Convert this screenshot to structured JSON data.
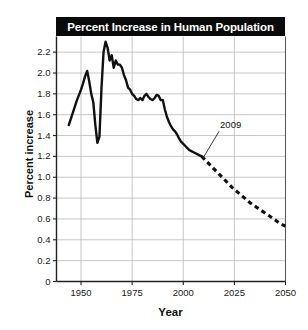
{
  "chart_data": {
    "type": "line",
    "title": "Percent Increase in Human Population",
    "xlabel": "Year",
    "ylabel": "Percent increase",
    "xlim": [
      1938,
      2050
    ],
    "ylim": [
      0,
      2.35
    ],
    "grid": true,
    "legend": false,
    "xticks": [
      "1950",
      "1975",
      "2000",
      "2025",
      "2050"
    ],
    "xtick_values": [
      1950,
      1975,
      2000,
      2025,
      2050
    ],
    "yticks": [
      "0",
      "0.2",
      "0.4",
      "0.6",
      "0.8",
      "1.0",
      "1.2",
      "1.4",
      "1.6",
      "1.8",
      "2.0",
      "2.2"
    ],
    "ytick_values": [
      0,
      0.2,
      0.4,
      0.6,
      0.8,
      1.0,
      1.2,
      1.4,
      1.6,
      1.8,
      2.0,
      2.2
    ],
    "annotations": [
      {
        "text": "2009",
        "x": 2009,
        "y": 1.2,
        "label_x": 2018,
        "label_y": 1.46,
        "leader": true
      }
    ],
    "series": [
      {
        "name": "Observed percent increase",
        "style": "solid",
        "color": "#111111",
        "x": [
          1944,
          1946,
          1948,
          1950,
          1951,
          1952,
          1953,
          1954,
          1955,
          1956,
          1957,
          1958,
          1959,
          1960,
          1961,
          1962,
          1963,
          1964,
          1965,
          1966,
          1967,
          1968,
          1969,
          1970,
          1971,
          1972,
          1973,
          1974,
          1975,
          1976,
          1977,
          1978,
          1979,
          1980,
          1981,
          1982,
          1983,
          1984,
          1985,
          1986,
          1987,
          1988,
          1989,
          1990,
          1991,
          1992,
          1993,
          1994,
          1995,
          1996,
          1997,
          1998,
          1999,
          2000,
          2001,
          2002,
          2003,
          2004,
          2005,
          2006,
          2007,
          2008,
          2009
        ],
        "y": [
          1.5,
          1.62,
          1.74,
          1.84,
          1.9,
          1.97,
          2.02,
          1.92,
          1.8,
          1.72,
          1.5,
          1.33,
          1.39,
          1.85,
          2.2,
          2.3,
          2.24,
          2.12,
          2.17,
          2.05,
          2.12,
          2.08,
          2.08,
          2.05,
          1.98,
          1.93,
          1.86,
          1.84,
          1.8,
          1.78,
          1.75,
          1.74,
          1.76,
          1.74,
          1.78,
          1.8,
          1.77,
          1.75,
          1.74,
          1.76,
          1.79,
          1.78,
          1.74,
          1.74,
          1.65,
          1.58,
          1.53,
          1.49,
          1.46,
          1.44,
          1.41,
          1.37,
          1.34,
          1.32,
          1.3,
          1.28,
          1.26,
          1.25,
          1.24,
          1.23,
          1.22,
          1.21,
          1.2
        ]
      },
      {
        "name": "Projected percent increase",
        "style": "dashed",
        "color": "#111111",
        "x": [
          2009,
          2012,
          2015,
          2018,
          2021,
          2024,
          2027,
          2030,
          2033,
          2036,
          2039,
          2042,
          2045,
          2047,
          2050
        ],
        "y": [
          1.2,
          1.14,
          1.08,
          1.02,
          0.96,
          0.9,
          0.85,
          0.8,
          0.75,
          0.71,
          0.67,
          0.63,
          0.59,
          0.56,
          0.53
        ]
      }
    ]
  }
}
